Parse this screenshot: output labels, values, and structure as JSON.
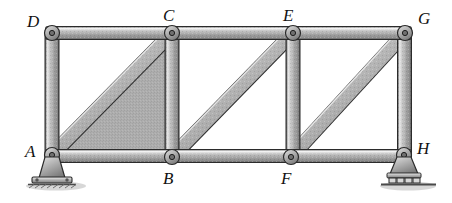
{
  "figure": {
    "kind": "structural-truss-diagram",
    "background_color": "#ffffff",
    "member_fill_color": "#a8a8a8",
    "member_highlight_color": "#e2e2e2",
    "member_outline_color": "#2e2e2e",
    "panel_shading_color": "#a6a6a6",
    "ground_color": "#555555"
  },
  "joints": [
    {
      "id": "D",
      "label": "D",
      "x": 52,
      "y": 33,
      "label_x": 27,
      "label_y": 13,
      "chord": "top"
    },
    {
      "id": "C",
      "label": "C",
      "x": 172,
      "y": 33,
      "label_x": 163,
      "label_y": 7,
      "chord": "top"
    },
    {
      "id": "E",
      "label": "E",
      "x": 293,
      "y": 33,
      "label_x": 283,
      "label_y": 7,
      "chord": "top"
    },
    {
      "id": "G",
      "label": "G",
      "x": 405,
      "y": 33,
      "label_x": 418,
      "label_y": 10,
      "chord": "top"
    },
    {
      "id": "A",
      "label": "A",
      "x": 52,
      "y": 155,
      "label_x": 25,
      "label_y": 143,
      "chord": "bottom"
    },
    {
      "id": "B",
      "label": "B",
      "x": 172,
      "y": 157,
      "label_x": 163,
      "label_y": 170,
      "chord": "bottom"
    },
    {
      "id": "F",
      "label": "F",
      "x": 291,
      "y": 157,
      "label_x": 281,
      "label_y": 170,
      "chord": "bottom"
    },
    {
      "id": "H",
      "label": "H",
      "x": 404,
      "y": 155,
      "label_x": 417,
      "label_y": 140,
      "chord": "bottom"
    }
  ],
  "members": [
    {
      "name": "top-chord-D-C",
      "from": "D",
      "to": "C",
      "type": "chord"
    },
    {
      "name": "top-chord-C-E",
      "from": "C",
      "to": "E",
      "type": "chord"
    },
    {
      "name": "top-chord-E-G",
      "from": "E",
      "to": "G",
      "type": "chord"
    },
    {
      "name": "bottom-chord-A-B",
      "from": "A",
      "to": "B",
      "type": "chord"
    },
    {
      "name": "bottom-chord-B-F",
      "from": "B",
      "to": "F",
      "type": "chord"
    },
    {
      "name": "bottom-chord-F-H",
      "from": "F",
      "to": "H",
      "type": "chord"
    },
    {
      "name": "vertical-A-D",
      "from": "A",
      "to": "D",
      "type": "vertical"
    },
    {
      "name": "vertical-B-C",
      "from": "B",
      "to": "C",
      "type": "vertical"
    },
    {
      "name": "vertical-F-E",
      "from": "F",
      "to": "E",
      "type": "vertical"
    },
    {
      "name": "vertical-H-G",
      "from": "H",
      "to": "G",
      "type": "vertical"
    },
    {
      "name": "diagonal-A-C",
      "from": "A",
      "to": "C",
      "type": "diagonal"
    },
    {
      "name": "diagonal-B-E",
      "from": "B",
      "to": "E",
      "type": "diagonal"
    },
    {
      "name": "diagonal-F-G",
      "from": "F",
      "to": "G",
      "type": "diagonal"
    }
  ],
  "panels": [
    {
      "name": "panel-1",
      "corners": "A-B-C-D",
      "shaded": true,
      "diagonal": "diagonal-A-C"
    },
    {
      "name": "panel-2",
      "corners": "B-F-E-C",
      "shaded": false,
      "diagonal": "diagonal-B-E"
    },
    {
      "name": "panel-3",
      "corners": "F-H-G-E",
      "shaded": false,
      "diagonal": "diagonal-F-G"
    }
  ],
  "supports": [
    {
      "name": "pin-support-A",
      "at_joint": "A",
      "type": "pin",
      "x": 52,
      "y": 155,
      "has_base_plate": true,
      "has_ground_hatch": true,
      "roller_count": 0
    },
    {
      "name": "roller-support-H",
      "at_joint": "H",
      "type": "roller",
      "x": 404,
      "y": 155,
      "has_base_plate": true,
      "has_ground_hatch": true,
      "roller_count": 4
    }
  ]
}
